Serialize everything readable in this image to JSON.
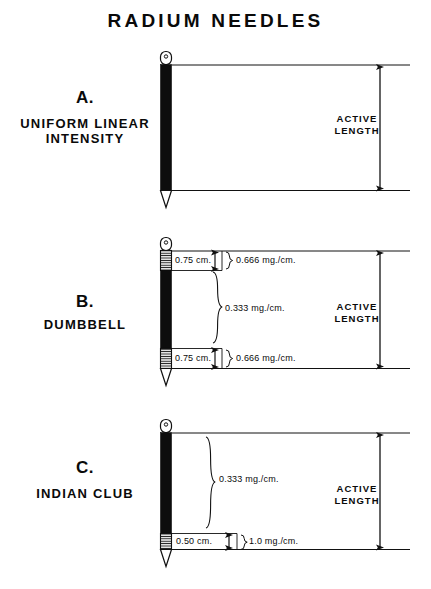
{
  "title": "RADIUM NEEDLES",
  "panels": [
    {
      "letter": "A.",
      "name": "UNIFORM LINEAR INTENSITY",
      "active_length_label": "ACTIVE\nLENGTH",
      "active_length_line1": "ACTIVE",
      "active_length_line2": "LENGTH",
      "segments": [],
      "dose_labels": []
    },
    {
      "letter": "B.",
      "name": "DUMBBELL",
      "active_length_line1": "ACTIVE",
      "active_length_line2": "LENGTH",
      "segments": [
        {
          "length": "0.75 cm.",
          "dose": "0.666 mg./cm."
        },
        {
          "length": "",
          "dose": "0.333 mg./cm."
        },
        {
          "length": "0.75 cm.",
          "dose": "0.666 mg./cm."
        }
      ]
    },
    {
      "letter": "C.",
      "name": "INDIAN CLUB",
      "active_length_line1": "ACTIVE",
      "active_length_line2": "LENGTH",
      "segments": [
        {
          "length": "",
          "dose": "0.333 mg./cm."
        },
        {
          "length": "0.50 cm.",
          "dose": "1.0 mg./cm."
        }
      ]
    }
  ],
  "colors": {
    "ink": "#0a0a0a",
    "line": "#1a1a1a",
    "paper": "#ffffff"
  }
}
